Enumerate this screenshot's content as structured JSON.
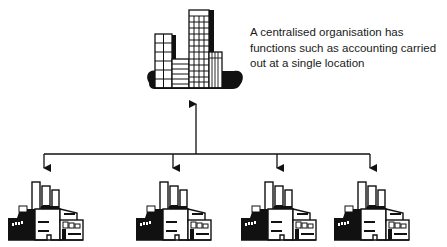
{
  "diagram": {
    "head_office": {
      "icon": "office-building-icon",
      "caption_lines": [
        "A centralised organisation has",
        "functions such as accounting carried",
        "out at a single location"
      ]
    },
    "branches": [
      {
        "icon": "factory-icon",
        "arrow_x": 44
      },
      {
        "icon": "factory-icon",
        "arrow_x": 173
      },
      {
        "icon": "factory-icon",
        "arrow_x": 277
      },
      {
        "icon": "factory-icon",
        "arrow_x": 370
      }
    ],
    "connector": {
      "trunk_x": 196,
      "bus_y": 154,
      "bus_x_start": 44,
      "bus_x_end": 370,
      "direction": "branches-to-head-office"
    },
    "colors": {
      "ink": "#111111",
      "paper": "#ffffff"
    }
  }
}
